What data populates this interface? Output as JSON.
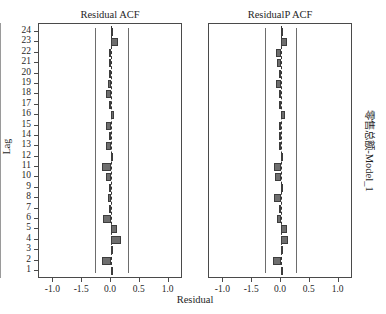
{
  "figure": {
    "x_axis_title": "Residual",
    "y_axis_title": "Lag",
    "model_label": "零售总额-Model_1"
  },
  "panels": [
    {
      "key": "acf",
      "title": "Residual ACF"
    },
    {
      "key": "pacf",
      "title": "ResidualP ACF"
    }
  ],
  "axis": {
    "x_tick_labels": [
      "-1.0",
      "-1.5",
      "0.0",
      "0.5",
      "1.0"
    ],
    "x_tick_values": [
      -1.0,
      -0.5,
      0.0,
      0.5,
      1.0
    ],
    "x_min": -1.25,
    "x_max": 1.25,
    "lag_labels": [
      "1",
      "2",
      "3",
      "4",
      "5",
      "6",
      "7",
      "8",
      "9",
      "10",
      "11",
      "12",
      "13",
      "14",
      "15",
      "16",
      "17",
      "18",
      "19",
      "20",
      "21",
      "22",
      "23",
      "24"
    ]
  },
  "chart_data": {
    "type": "bar",
    "orientation": "horizontal",
    "subtitle": "零售总额-Model_1",
    "xlabel": "Residual",
    "ylabel": "Lag",
    "xlim": [
      -1.25,
      1.25
    ],
    "xticks": [
      -1.0,
      -0.5,
      0.0,
      0.5,
      1.0
    ],
    "xticklabels": [
      "-1.0",
      "-1.5",
      "0.0",
      "0.5",
      "1.0"
    ],
    "grid": false,
    "legend": false,
    "categories": [
      1,
      2,
      3,
      4,
      5,
      6,
      7,
      8,
      9,
      10,
      11,
      12,
      13,
      14,
      15,
      16,
      17,
      18,
      19,
      20,
      21,
      22,
      23,
      24
    ],
    "series": [
      {
        "name": "Residual ACF",
        "panel": "left",
        "confidence_limits": [
          -0.27,
          0.3
        ],
        "values": [
          0.01,
          -0.15,
          0.0,
          0.17,
          0.11,
          -0.14,
          -0.01,
          -0.06,
          -0.02,
          -0.08,
          -0.16,
          0.01,
          -0.08,
          -0.02,
          -0.08,
          0.05,
          -0.01,
          -0.08,
          -0.05,
          -0.01,
          -0.03,
          -0.04,
          0.13,
          0.0
        ]
      },
      {
        "name": "ResidualP ACF",
        "panel": "right",
        "confidence_limits": [
          -0.27,
          0.26
        ],
        "values": [
          0.0,
          -0.14,
          0.0,
          0.13,
          0.11,
          -0.07,
          -0.02,
          -0.13,
          0.01,
          -0.1,
          -0.13,
          0.01,
          -0.02,
          -0.01,
          -0.03,
          0.07,
          -0.01,
          -0.02,
          -0.08,
          -0.01,
          -0.07,
          -0.09,
          0.1,
          0.01
        ]
      }
    ]
  }
}
